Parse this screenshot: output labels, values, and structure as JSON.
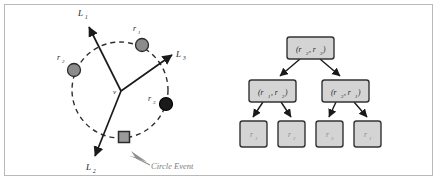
{
  "figure": {
    "border_color": "#b9b9b9",
    "background": "#ffffff"
  },
  "left_panel": {
    "name": "circle-event-diagram",
    "edge_labels": [
      {
        "id": "L1",
        "base": "L",
        "sub": "1",
        "x": 78,
        "y": 16
      },
      {
        "id": "L3",
        "base": "L",
        "sub": "3",
        "x": 176,
        "y": 57
      },
      {
        "id": "L2",
        "base": "L",
        "sub": "2",
        "x": 86,
        "y": 167
      }
    ],
    "sites": [
      {
        "id": "r1",
        "base": "r",
        "sub": "1",
        "cx": 142,
        "cy": 45,
        "r": 6.5,
        "fill": "#8c8c8c",
        "label_x": 133,
        "label_y": 31
      },
      {
        "id": "r2",
        "base": "r",
        "sub": "2",
        "cx": 74,
        "cy": 70,
        "r": 6.5,
        "fill": "#8c8c8c",
        "label_x": 57,
        "label_y": 60
      },
      {
        "id": "r3",
        "base": "r",
        "sub": "3",
        "cx": 166,
        "cy": 104,
        "r": 6.5,
        "fill": "#1a1a1a",
        "label_x": 148,
        "label_y": 100
      }
    ],
    "vertex": {
      "id": "v",
      "label": "v",
      "x": 121,
      "y": 92,
      "label_x": 113,
      "label_y": 92
    },
    "circle": {
      "cx": 120,
      "cy": 90,
      "r": 48,
      "stroke": "#333333",
      "dashed": true
    },
    "circle_event_marker": {
      "x": 124,
      "y": 137,
      "size": 11,
      "fill": "#9a9a9a",
      "stroke": "#2b2b2b"
    },
    "caption": {
      "text": "Circle Event",
      "x": 151,
      "y": 168
    }
  },
  "right_panel": {
    "name": "beach-line-tree",
    "node_fill": "#d4d4d4",
    "node_stroke": "#333333",
    "root": {
      "id": "root",
      "parts": [
        {
          "base": "r",
          "sub": "2"
        },
        {
          "base": "r",
          "sub": "3"
        }
      ],
      "text": "(r2, r3)",
      "x": 287,
      "y": 37,
      "w": 47,
      "h": 22
    },
    "internal": [
      {
        "id": "internal-left",
        "parts": [
          {
            "base": "r",
            "sub": "1"
          },
          {
            "base": "r",
            "sub": "2"
          }
        ],
        "text": "(r1, r2)",
        "x": 249,
        "y": 80,
        "w": 47,
        "h": 22
      },
      {
        "id": "internal-right",
        "parts": [
          {
            "base": "r",
            "sub": "3"
          },
          {
            "base": "r",
            "sub": "1"
          }
        ],
        "text": "(r3, r1)",
        "x": 322,
        "y": 80,
        "w": 47,
        "h": 22
      }
    ],
    "leaves": [
      {
        "id": "leaf-1",
        "base": "r",
        "sub": "1",
        "x": 240,
        "y": 121,
        "w": 27,
        "h": 26
      },
      {
        "id": "leaf-2",
        "base": "r",
        "sub": "2",
        "x": 278,
        "y": 121,
        "w": 27,
        "h": 26
      },
      {
        "id": "leaf-3",
        "base": "r",
        "sub": "3",
        "x": 316,
        "y": 121,
        "w": 27,
        "h": 26
      },
      {
        "id": "leaf-4",
        "base": "r",
        "sub": "1",
        "x": 354,
        "y": 121,
        "w": 27,
        "h": 26
      }
    ]
  }
}
